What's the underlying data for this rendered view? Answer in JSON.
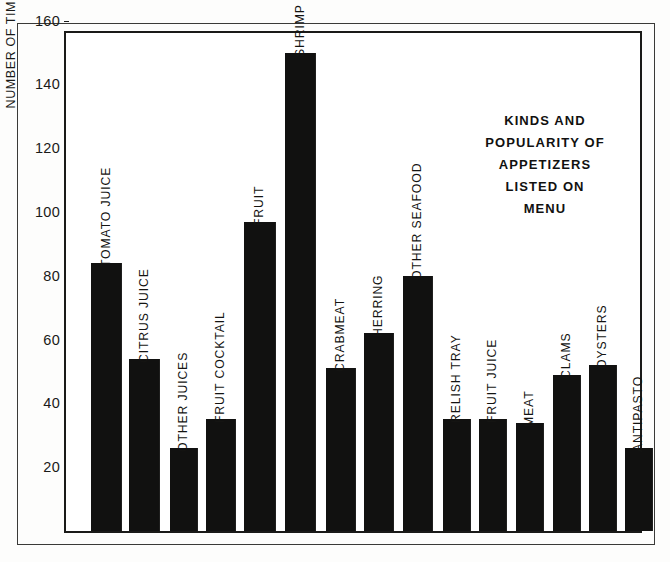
{
  "chart_data": {
    "type": "bar",
    "title_lines": [
      "KINDS AND",
      "POPULARITY OF",
      "APPETIZERS",
      "LISTED ON",
      "MENU"
    ],
    "xlabel": "",
    "ylabel": "NUMBER OF TIMES LISTED",
    "ylim": [
      0,
      168
    ],
    "yticks": [
      20,
      40,
      60,
      80,
      100,
      120,
      140,
      160
    ],
    "ytick_labels": [
      "20",
      "40",
      "60",
      "80",
      "100",
      "120",
      "140",
      "160"
    ],
    "grid": false,
    "legend": false,
    "bar_color": "#111110",
    "categories": [
      "TOMATO JUICE",
      "CITRUS JUICE",
      "OTHER JUICES",
      "FRUIT COCKTAIL",
      "FRUIT",
      "SHRIMP COCKTAIL",
      "CRABMEAT",
      "HERRING",
      "OTHER SEAFOOD",
      "RELISH TRAY",
      "FRUIT JUICE",
      "MEAT",
      "CLAMS",
      "OYSTERS",
      "ANTIPASTO"
    ],
    "values": [
      84,
      54,
      26,
      35,
      97,
      150,
      51,
      62,
      80,
      35,
      35,
      34,
      49,
      52,
      26
    ]
  },
  "bars": [
    {
      "label": "TOMATO JUICE",
      "value": 84,
      "x": 91,
      "w": 31,
      "label_outside": true,
      "label_y_offset": 10
    },
    {
      "label": "CITRUS JUICE",
      "value": 54,
      "x": 129,
      "w": 31,
      "label_outside": true,
      "label_y_offset": 10
    },
    {
      "label": "OTHER JUICES",
      "value": 26,
      "x": 170,
      "w": 28,
      "label_outside": true,
      "label_y_offset": 10
    },
    {
      "label": "FRUIT COCKTAIL",
      "value": 35,
      "x": 206,
      "w": 30,
      "label_outside": true,
      "label_y_offset": 10
    },
    {
      "label": "FRUIT",
      "value": 97,
      "x": 244,
      "w": 32,
      "label_outside": true,
      "label_y_offset": 10
    },
    {
      "label": "SHRIMP COCKTAIL",
      "value": 150,
      "x": 285,
      "w": 31,
      "label_outside": true,
      "label_y_offset": 10
    },
    {
      "label": "CRABMEAT",
      "value": 51,
      "x": 326,
      "w": 30,
      "label_outside": true,
      "label_y_offset": 10
    },
    {
      "label": "HERRING",
      "value": 62,
      "x": 364,
      "w": 30,
      "label_outside": true,
      "label_y_offset": 10
    },
    {
      "label": "OTHER SEAFOOD",
      "value": 80,
      "x": 403,
      "w": 30,
      "label_outside": true,
      "label_y_offset": 10
    },
    {
      "label": "RELISH TRAY",
      "value": 35,
      "x": 443,
      "w": 28,
      "label_outside": true,
      "label_y_offset": 10
    },
    {
      "label": "FRUIT JUICE",
      "value": 35,
      "x": 479,
      "w": 28,
      "label_outside": true,
      "label_y_offset": 10
    },
    {
      "label": "MEAT",
      "value": 34,
      "x": 516,
      "w": 28,
      "label_outside": true,
      "label_y_offset": 10
    },
    {
      "label": "CLAMS",
      "value": 49,
      "x": 553,
      "w": 28,
      "label_outside": true,
      "label_y_offset": 10
    },
    {
      "label": "OYSTERS",
      "value": 52,
      "x": 589,
      "w": 28,
      "label_outside": true,
      "label_y_offset": 10
    },
    {
      "label": "ANTIPASTO",
      "value": 26,
      "x": 625,
      "w": 28,
      "label_outside": true,
      "label_y_offset": 10
    }
  ],
  "axis": {
    "y_title": "NUMBER OF TIMES LISTED",
    "ticks": [
      {
        "label": "160",
        "value": 160
      },
      {
        "label": "140",
        "value": 140
      },
      {
        "label": "120",
        "value": 120
      },
      {
        "label": "100",
        "value": 100
      },
      {
        "label": "80",
        "value": 80
      },
      {
        "label": "60",
        "value": 60
      },
      {
        "label": "40",
        "value": 40
      },
      {
        "label": "20",
        "value": 20
      }
    ]
  },
  "geometry": {
    "baseline_y": 531,
    "px_per_unit": 3.19,
    "plot_left": 64,
    "plot_right": 642,
    "plot_top": 31
  }
}
